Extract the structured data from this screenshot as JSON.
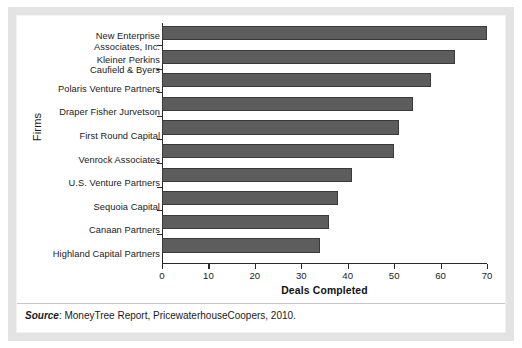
{
  "chart_data": {
    "type": "bar",
    "orientation": "horizontal",
    "title": "",
    "xlabel": "Deals Completed",
    "ylabel": "Firms",
    "xlim": [
      0,
      70
    ],
    "xticks": [
      0,
      10,
      20,
      30,
      40,
      50,
      60,
      70
    ],
    "xtick_labels": [
      "0",
      "10",
      "20",
      "30",
      "40",
      "50",
      "60",
      "70"
    ],
    "grid": false,
    "legend": false,
    "categories": [
      "New Enterprise\nAssociates, Inc.",
      "Kleiner Perkins\nCaufield & Byers",
      "Polaris Venture Partners",
      "Draper Fisher Jurvetson",
      "First Round Capital",
      "Venrock Associates",
      "U.S. Venture Partners",
      "Sequoia Capital",
      "Canaan Partners",
      "Highland Capital Partners"
    ],
    "values": [
      70,
      63,
      58,
      54,
      51,
      50,
      41,
      38,
      36,
      34
    ],
    "bar_color": "#5d5d5d",
    "bar_edge_color": "#3a3a3a"
  },
  "source": {
    "prefix": "Source",
    "text": ": MoneyTree Report, PricewaterhouseCoopers, 2010."
  }
}
